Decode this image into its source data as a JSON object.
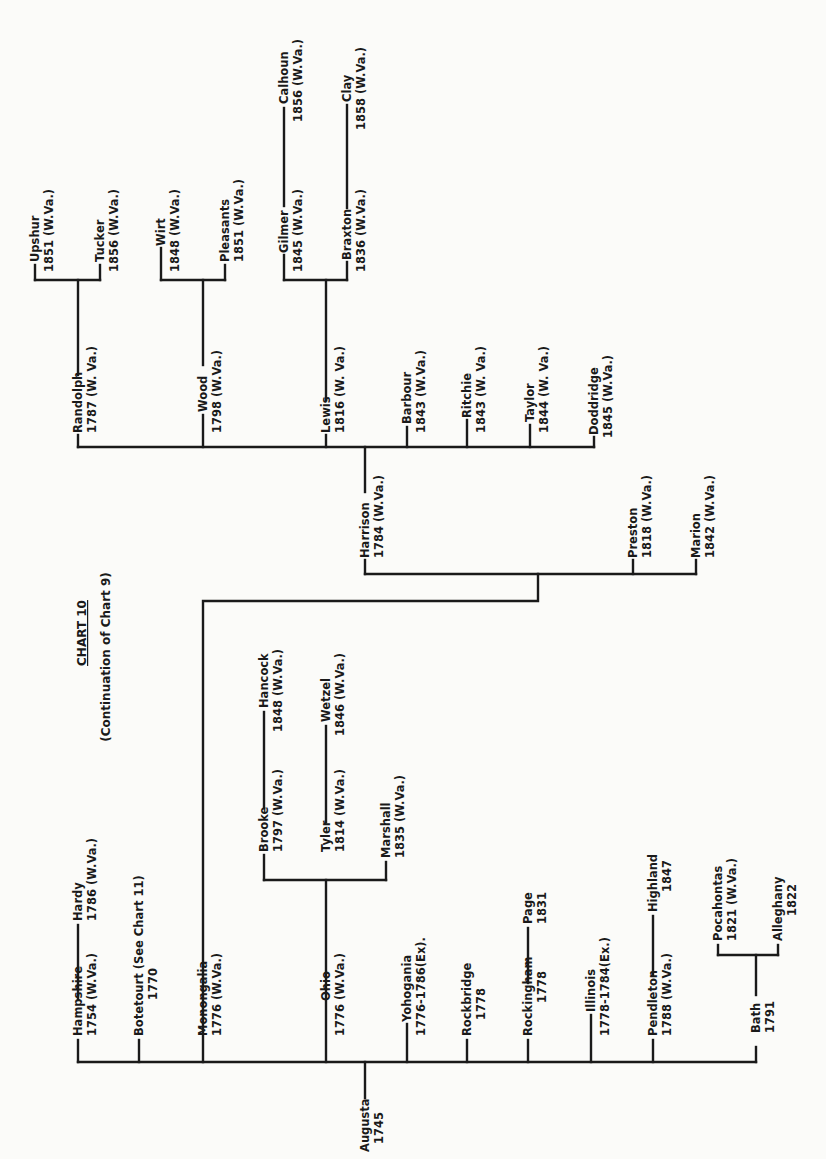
{
  "title": {
    "heading": "CHART 10",
    "subheading": "(Continuation of Chart 9)"
  },
  "root": {
    "name": "Augusta",
    "year": "1745"
  },
  "nodes": {
    "hampshire": {
      "name": "Hampshire",
      "year": "1754 (W.Va.)"
    },
    "hardy": {
      "name": "Hardy",
      "year": "1786 (W.Va.)"
    },
    "botetourt": {
      "name": "Botetourt (See Chart 11)",
      "year": "1770"
    },
    "monongalia": {
      "name": "Monongalia",
      "year": "1776 (W.Va.)"
    },
    "harrison": {
      "name": "Harrison",
      "year": "1784 (W.Va.)"
    },
    "randolph": {
      "name": "Randolph",
      "year": "1787 (W. Va.)"
    },
    "upshur": {
      "name": "Upshur",
      "year": "1851 (W.Va.)"
    },
    "tucker": {
      "name": "Tucker",
      "year": "1856 (W.Va.)"
    },
    "wood": {
      "name": "Wood",
      "year": "1798 (W.Va.)"
    },
    "wirt": {
      "name": "Wirt",
      "year": "1848 (W.Va.)"
    },
    "pleasants": {
      "name": "Pleasants",
      "year": "1851 (W.Va.)"
    },
    "lewis": {
      "name": "Lewis",
      "year": "1816 (W. Va.)"
    },
    "gilmer": {
      "name": "Gilmer",
      "year": "1845 (W.Va.)"
    },
    "calhoun": {
      "name": "Calhoun",
      "year": "1856 (W.Va.)"
    },
    "braxton": {
      "name": "Braxton",
      "year": "1836 (W.Va.)"
    },
    "clay": {
      "name": "Clay",
      "year": "1858 (W.Va.)"
    },
    "barbour": {
      "name": "Barbour",
      "year": "1843 (W.Va.)"
    },
    "ritchie": {
      "name": "Ritchie",
      "year": "1843 (W. Va.)"
    },
    "taylor": {
      "name": "Taylor",
      "year": "1844 (W. Va.)"
    },
    "doddridge": {
      "name": "Doddridge",
      "year": "1845 (W.Va.)"
    },
    "preston": {
      "name": "Preston",
      "year": "1818 (W.Va.)"
    },
    "marion": {
      "name": "Marion",
      "year": "1842 (W.Va.)"
    },
    "ohio": {
      "name": "Ohio",
      "year": "1776 (W.Va.)"
    },
    "brooke": {
      "name": "Brooke",
      "year": "1797 (W.Va.)"
    },
    "hancock": {
      "name": "Hancock",
      "year": "1848 (W.Va.)"
    },
    "tyler": {
      "name": "Tyler",
      "year": "1814 (W.Va.)"
    },
    "wetzel": {
      "name": "Wetzel",
      "year": "1846 (W.Va.)"
    },
    "marshall": {
      "name": "Marshall",
      "year": "1835 (W.Va.)"
    },
    "yohogania": {
      "name": "Yohogania",
      "year": "1776-1786(Ex)."
    },
    "rockbridge": {
      "name": "Rockbridge",
      "year": "1778"
    },
    "rockingham": {
      "name": "Rockingham",
      "year": "1778"
    },
    "page": {
      "name": "Page",
      "year": "1831"
    },
    "illinois": {
      "name": "Illinois",
      "year": "1778-1784(Ex.)"
    },
    "pendleton": {
      "name": "Pendleton",
      "year": "1788 (W.Va.)"
    },
    "highland": {
      "name": "Highland",
      "year": "1847"
    },
    "bath": {
      "name": "Bath",
      "year": "1791"
    },
    "pocahontas": {
      "name": "Pocahontas",
      "year": "1821 (W.Va.)"
    },
    "alleghany": {
      "name": "Alleghany",
      "year": "1822"
    }
  },
  "tree": {
    "name": "Augusta",
    "children": [
      {
        "name": "Hampshire",
        "children": [
          {
            "name": "Hardy"
          }
        ]
      },
      {
        "name": "Botetourt"
      },
      {
        "name": "Monongalia",
        "children": [
          {
            "name": "Harrison",
            "children": [
              {
                "name": "Randolph",
                "children": [
                  {
                    "name": "Upshur"
                  },
                  {
                    "name": "Tucker"
                  }
                ]
              },
              {
                "name": "Wood",
                "children": [
                  {
                    "name": "Wirt"
                  },
                  {
                    "name": "Pleasants"
                  }
                ]
              },
              {
                "name": "Lewis",
                "children": [
                  {
                    "name": "Gilmer",
                    "children": [
                      {
                        "name": "Calhoun"
                      }
                    ]
                  },
                  {
                    "name": "Braxton",
                    "children": [
                      {
                        "name": "Clay"
                      }
                    ]
                  }
                ]
              },
              {
                "name": "Barbour"
              },
              {
                "name": "Ritchie"
              },
              {
                "name": "Taylor"
              },
              {
                "name": "Doddridge"
              }
            ]
          },
          {
            "name": "Preston"
          },
          {
            "name": "Marion"
          }
        ]
      },
      {
        "name": "Ohio",
        "children": [
          {
            "name": "Brooke",
            "children": [
              {
                "name": "Hancock"
              }
            ]
          },
          {
            "name": "Tyler",
            "children": [
              {
                "name": "Wetzel"
              }
            ]
          },
          {
            "name": "Marshall"
          }
        ]
      },
      {
        "name": "Yohogania"
      },
      {
        "name": "Rockbridge"
      },
      {
        "name": "Rockingham",
        "children": [
          {
            "name": "Page"
          }
        ]
      },
      {
        "name": "Illinois"
      },
      {
        "name": "Pendleton",
        "children": [
          {
            "name": "Highland"
          }
        ]
      },
      {
        "name": "Bath",
        "children": [
          {
            "name": "Pocahontas"
          },
          {
            "name": "Alleghany"
          }
        ]
      }
    ]
  }
}
